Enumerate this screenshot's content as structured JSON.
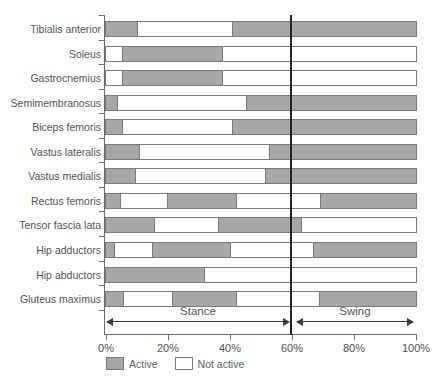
{
  "chart_data": {
    "type": "bar",
    "orientation": "horizontal",
    "title": "",
    "xlabel": "",
    "ylabel": "",
    "x_range_percent": [
      0,
      100
    ],
    "x_tick_labels": [
      "0%",
      "20%",
      "40%",
      "60%",
      "80%",
      "100%"
    ],
    "grid": false,
    "divider_percent": 60,
    "phases": [
      {
        "label": "Stance",
        "from_percent": 0,
        "to_percent": 60
      },
      {
        "label": "Swing",
        "from_percent": 60,
        "to_percent": 100
      }
    ],
    "legend": [
      {
        "label": "Active",
        "state": "active"
      },
      {
        "label": "Not active",
        "state": "not_active"
      }
    ],
    "colors": {
      "active_fill": "#a7a7a7",
      "not_active_fill": "#ffffff",
      "bar_border": "#787878",
      "axis": "#6a6b6d",
      "divider": "#232323",
      "text": "#515255"
    },
    "muscles": [
      {
        "name": "Tibialis anterior",
        "segments": [
          {
            "state": "active",
            "from": 0,
            "to": 10
          },
          {
            "state": "not_active",
            "from": 10,
            "to": 41
          },
          {
            "state": "active",
            "from": 41,
            "to": 100
          }
        ]
      },
      {
        "name": "Soleus",
        "segments": [
          {
            "state": "not_active",
            "from": 0,
            "to": 5.5
          },
          {
            "state": "active",
            "from": 5.5,
            "to": 37.5
          },
          {
            "state": "not_active",
            "from": 37.5,
            "to": 100
          }
        ]
      },
      {
        "name": "Gastrocnemius",
        "segments": [
          {
            "state": "not_active",
            "from": 0,
            "to": 5.5
          },
          {
            "state": "active",
            "from": 5.5,
            "to": 37.5
          },
          {
            "state": "not_active",
            "from": 37.5,
            "to": 100
          }
        ]
      },
      {
        "name": "Semimembranosus",
        "segments": [
          {
            "state": "active",
            "from": 0,
            "to": 3.5
          },
          {
            "state": "not_active",
            "from": 3.5,
            "to": 45.5
          },
          {
            "state": "active",
            "from": 45.5,
            "to": 100
          }
        ]
      },
      {
        "name": "Biceps femoris",
        "segments": [
          {
            "state": "active",
            "from": 0,
            "to": 5
          },
          {
            "state": "not_active",
            "from": 5,
            "to": 41
          },
          {
            "state": "active",
            "from": 41,
            "to": 100
          }
        ]
      },
      {
        "name": "Vastus lateralis",
        "segments": [
          {
            "state": "active",
            "from": 0,
            "to": 10.5
          },
          {
            "state": "not_active",
            "from": 10.5,
            "to": 53
          },
          {
            "state": "active",
            "from": 53,
            "to": 100
          }
        ]
      },
      {
        "name": "Vastus medialis",
        "segments": [
          {
            "state": "active",
            "from": 0,
            "to": 9.5
          },
          {
            "state": "not_active",
            "from": 9.5,
            "to": 51.5
          },
          {
            "state": "active",
            "from": 51.5,
            "to": 100
          }
        ]
      },
      {
        "name": "Rectus femoris",
        "segments": [
          {
            "state": "active",
            "from": 0,
            "to": 4.5
          },
          {
            "state": "not_active",
            "from": 4.5,
            "to": 20
          },
          {
            "state": "active",
            "from": 20,
            "to": 42
          },
          {
            "state": "not_active",
            "from": 42,
            "to": 69.5
          },
          {
            "state": "active",
            "from": 69.5,
            "to": 100
          }
        ]
      },
      {
        "name": "Tensor fascia lata",
        "segments": [
          {
            "state": "active",
            "from": 0,
            "to": 15.5
          },
          {
            "state": "not_active",
            "from": 15.5,
            "to": 36.5
          },
          {
            "state": "active",
            "from": 36.5,
            "to": 63
          },
          {
            "state": "not_active",
            "from": 63,
            "to": 100
          }
        ]
      },
      {
        "name": "Hip adductors",
        "segments": [
          {
            "state": "active",
            "from": 0,
            "to": 2.7
          },
          {
            "state": "not_active",
            "from": 2.7,
            "to": 15
          },
          {
            "state": "active",
            "from": 15,
            "to": 40
          },
          {
            "state": "not_active",
            "from": 40,
            "to": 67
          },
          {
            "state": "active",
            "from": 67,
            "to": 100
          }
        ]
      },
      {
        "name": "Hip abductors",
        "segments": [
          {
            "state": "active",
            "from": 0,
            "to": 31.5
          },
          {
            "state": "not_active",
            "from": 31.5,
            "to": 100
          }
        ]
      },
      {
        "name": "Gluteus maximus",
        "segments": [
          {
            "state": "active",
            "from": 0,
            "to": 5.5
          },
          {
            "state": "not_active",
            "from": 5.5,
            "to": 21.5
          },
          {
            "state": "active",
            "from": 21.5,
            "to": 42
          },
          {
            "state": "not_active",
            "from": 42,
            "to": 69
          },
          {
            "state": "active",
            "from": 69,
            "to": 100
          }
        ]
      }
    ]
  }
}
